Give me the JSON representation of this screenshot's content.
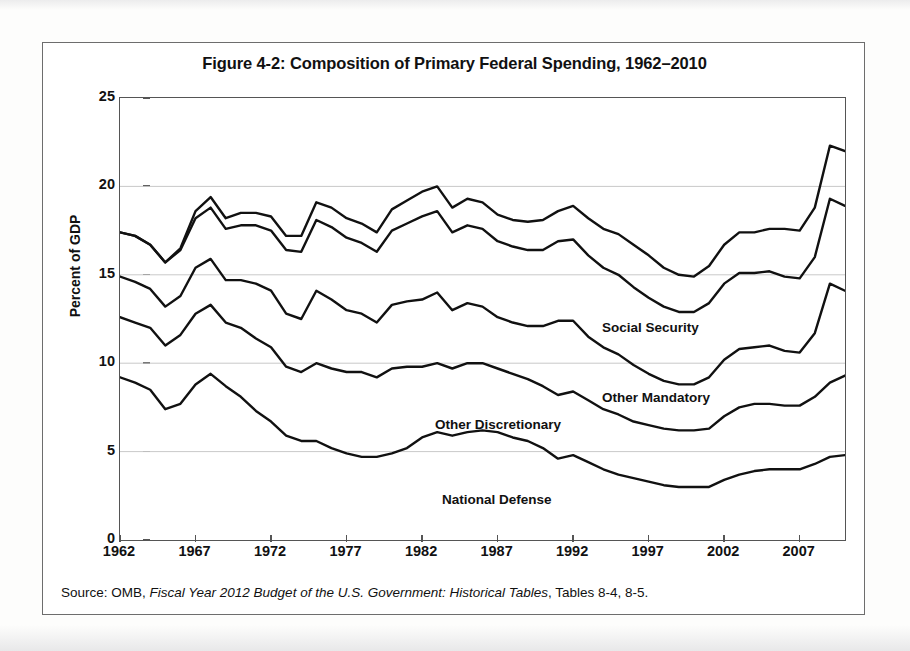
{
  "figure": {
    "title": "Figure 4-2: Composition of Primary Federal Spending, 1962–2010",
    "source_prefix": "Source: OMB, ",
    "source_italic": "Fiscal Year 2012 Budget of the U.S. Government: Historical Tables",
    "source_suffix": ", Tables 8-4, 8-5."
  },
  "chart_data": {
    "type": "area",
    "stacked": true,
    "title": "Figure 4-2: Composition of Primary Federal Spending, 1962–2010",
    "xlabel": "",
    "ylabel": "Percent of GDP",
    "xlim": [
      1962,
      2010
    ],
    "ylim": [
      0,
      25
    ],
    "yticks": [
      0,
      5,
      10,
      15,
      20,
      25
    ],
    "ytick_labels": [
      "0",
      "5",
      "10",
      "15",
      "20",
      "25"
    ],
    "xticks": [
      1962,
      1967,
      1972,
      1977,
      1982,
      1987,
      1992,
      1997,
      2002,
      2007
    ],
    "xtick_labels": [
      "1962",
      "1967",
      "1972",
      "1977",
      "1982",
      "1987",
      "1992",
      "1997",
      "2002",
      "2007"
    ],
    "grid": "horizontal",
    "legend_position": "inline-annotations",
    "line_color": "#111111",
    "x": [
      1962,
      1963,
      1964,
      1965,
      1966,
      1967,
      1968,
      1969,
      1970,
      1971,
      1972,
      1973,
      1974,
      1975,
      1976,
      1977,
      1978,
      1979,
      1980,
      1981,
      1982,
      1983,
      1984,
      1985,
      1986,
      1987,
      1988,
      1989,
      1990,
      1991,
      1992,
      1993,
      1994,
      1995,
      1996,
      1997,
      1998,
      1999,
      2000,
      2001,
      2002,
      2003,
      2004,
      2005,
      2006,
      2007,
      2008,
      2009,
      2010
    ],
    "series": [
      {
        "name": "National Defense",
        "values": [
          9.2,
          8.9,
          8.5,
          7.4,
          7.7,
          8.8,
          9.4,
          8.7,
          8.1,
          7.3,
          6.7,
          5.9,
          5.6,
          5.6,
          5.2,
          4.9,
          4.7,
          4.7,
          4.9,
          5.2,
          5.8,
          6.1,
          5.9,
          6.1,
          6.2,
          6.1,
          5.8,
          5.6,
          5.2,
          4.6,
          4.8,
          4.4,
          4.0,
          3.7,
          3.5,
          3.3,
          3.1,
          3.0,
          3.0,
          3.0,
          3.4,
          3.7,
          3.9,
          4.0,
          4.0,
          4.0,
          4.3,
          4.7,
          4.8
        ]
      },
      {
        "name": "Other Discretionary",
        "values": [
          3.4,
          3.4,
          3.5,
          3.6,
          3.9,
          4.0,
          3.9,
          3.6,
          3.9,
          4.1,
          4.2,
          3.9,
          3.9,
          4.4,
          4.5,
          4.6,
          4.8,
          4.5,
          4.8,
          4.6,
          4.0,
          3.9,
          3.8,
          3.9,
          3.8,
          3.6,
          3.6,
          3.5,
          3.5,
          3.6,
          3.6,
          3.5,
          3.4,
          3.4,
          3.2,
          3.2,
          3.2,
          3.2,
          3.2,
          3.3,
          3.6,
          3.8,
          3.8,
          3.7,
          3.6,
          3.6,
          3.8,
          4.2,
          4.5
        ]
      },
      {
        "name": "Other Mandatory",
        "values": [
          2.3,
          2.3,
          2.2,
          2.2,
          2.2,
          2.6,
          2.6,
          2.4,
          2.7,
          3.1,
          3.2,
          3.0,
          3.0,
          4.1,
          3.9,
          3.5,
          3.3,
          3.1,
          3.6,
          3.7,
          3.8,
          4.0,
          3.3,
          3.4,
          3.2,
          2.9,
          2.9,
          3.0,
          3.4,
          4.2,
          4.0,
          3.6,
          3.5,
          3.4,
          3.2,
          2.9,
          2.7,
          2.6,
          2.6,
          2.9,
          3.2,
          3.3,
          3.2,
          3.3,
          3.1,
          3.0,
          3.6,
          5.6,
          4.8
        ]
      },
      {
        "name": "Social Security",
        "values": [
          2.5,
          2.6,
          2.5,
          2.5,
          2.6,
          2.8,
          2.9,
          2.9,
          3.1,
          3.3,
          3.4,
          3.6,
          3.8,
          4.0,
          4.1,
          4.1,
          4.0,
          4.0,
          4.2,
          4.4,
          4.7,
          4.6,
          4.4,
          4.4,
          4.4,
          4.3,
          4.3,
          4.3,
          4.3,
          4.5,
          4.6,
          4.6,
          4.5,
          4.5,
          4.4,
          4.3,
          4.2,
          4.1,
          4.1,
          4.2,
          4.3,
          4.3,
          4.2,
          4.2,
          4.2,
          4.2,
          4.3,
          4.8,
          4.8
        ]
      },
      {
        "name": "Medicare",
        "values": [
          0.0,
          0.0,
          0.0,
          0.0,
          0.1,
          0.4,
          0.6,
          0.6,
          0.7,
          0.7,
          0.8,
          0.8,
          0.9,
          1.0,
          1.1,
          1.1,
          1.1,
          1.1,
          1.2,
          1.3,
          1.4,
          1.4,
          1.4,
          1.5,
          1.5,
          1.5,
          1.5,
          1.6,
          1.7,
          1.7,
          1.9,
          2.1,
          2.2,
          2.3,
          2.4,
          2.4,
          2.2,
          2.1,
          2.0,
          2.1,
          2.2,
          2.3,
          2.3,
          2.4,
          2.7,
          2.7,
          2.8,
          3.0,
          3.1
        ]
      }
    ],
    "annotations": [
      {
        "label": "Medicare",
        "x_px": 930,
        "y_px": 237
      },
      {
        "label": "Social Security",
        "x_px": 600,
        "y_px": 318
      },
      {
        "label": "Other Mandatory",
        "x_px": 600,
        "y_px": 388
      },
      {
        "label": "Other Discretionary",
        "x_px": 433,
        "y_px": 415
      },
      {
        "label": "National Defense",
        "x_px": 440,
        "y_px": 490
      }
    ]
  }
}
